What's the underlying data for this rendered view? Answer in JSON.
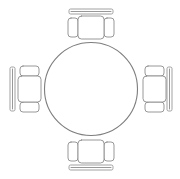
{
  "drawing": {
    "title": "Round Table with Four Chairs",
    "view": "top-view floor plan",
    "style": "line art",
    "background_color": "#ffffff",
    "line_color": "#8c8c8c",
    "canvas": {
      "width": 180,
      "height": 179
    }
  },
  "table": {
    "label": "round-table",
    "shape": "circle",
    "center": {
      "x": 91,
      "y": 89
    },
    "radius": 46.5,
    "stroke_color": "#7d7d7d"
  },
  "chairs": [
    {
      "id": "chair-north",
      "label": "Chair North",
      "orientation": "facing-down",
      "position": "top",
      "seat": {
        "x": 78,
        "y": 16,
        "width": 26,
        "height": 23
      },
      "armrest_left": {
        "x": 68,
        "y": 18,
        "width": 10,
        "height": 19
      },
      "armrest_right": {
        "x": 104,
        "y": 18,
        "width": 10,
        "height": 19
      },
      "backrest": {
        "x": 69,
        "y": 9,
        "width": 44,
        "height": 5
      }
    },
    {
      "id": "chair-east",
      "label": "Chair East",
      "orientation": "facing-left",
      "position": "right",
      "seat": {
        "x": 143,
        "y": 76,
        "width": 23,
        "height": 26
      },
      "armrest_top": {
        "x": 145,
        "y": 66,
        "width": 19,
        "height": 10
      },
      "armrest_bottom": {
        "x": 145,
        "y": 102,
        "width": 19,
        "height": 10
      },
      "backrest": {
        "x": 167,
        "y": 67,
        "width": 5,
        "height": 44
      }
    },
    {
      "id": "chair-south",
      "label": "Chair South",
      "orientation": "facing-up",
      "position": "bottom",
      "seat": {
        "x": 78,
        "y": 140,
        "width": 26,
        "height": 23
      },
      "armrest_left": {
        "x": 68,
        "y": 142,
        "width": 10,
        "height": 19
      },
      "armrest_right": {
        "x": 104,
        "y": 142,
        "width": 10,
        "height": 19
      },
      "backrest": {
        "x": 69,
        "y": 165,
        "width": 44,
        "height": 5
      }
    },
    {
      "id": "chair-west",
      "label": "Chair West",
      "orientation": "facing-right",
      "position": "left",
      "seat": {
        "x": 18,
        "y": 76,
        "width": 23,
        "height": 26
      },
      "armrest_top": {
        "x": 20,
        "y": 66,
        "width": 19,
        "height": 10
      },
      "armrest_bottom": {
        "x": 20,
        "y": 102,
        "width": 19,
        "height": 10
      },
      "backrest": {
        "x": 10,
        "y": 67,
        "width": 5,
        "height": 44
      }
    }
  ],
  "counts": {
    "tables": 1,
    "chairs": 4
  }
}
